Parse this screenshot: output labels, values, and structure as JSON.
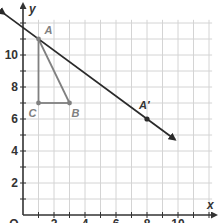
{
  "chart_data": {
    "type": "scatter",
    "title": "",
    "xlabel": "x",
    "ylabel": "y",
    "xlim": [
      0,
      12.5
    ],
    "ylim": [
      0,
      12
    ],
    "grid": true,
    "x_ticks": [
      0,
      2,
      4,
      6,
      8,
      10
    ],
    "y_ticks": [
      2,
      4,
      6,
      8,
      10
    ],
    "x_tick_labels": [
      "O",
      "2",
      "4",
      "6",
      "8",
      "10"
    ],
    "y_tick_labels": [
      "2",
      "4",
      "6",
      "8",
      "10"
    ],
    "points": [
      {
        "label": "A",
        "x": 1,
        "y": 11
      },
      {
        "label": "B",
        "x": 3,
        "y": 7
      },
      {
        "label": "C",
        "x": 1,
        "y": 7
      },
      {
        "label": "A'",
        "x": 8,
        "y": 6
      }
    ],
    "segments": [
      {
        "from": "A",
        "to": "C"
      },
      {
        "from": "C",
        "to": "B"
      },
      {
        "from": "A",
        "to": "B"
      }
    ],
    "line": {
      "through": [
        "A",
        "A'"
      ],
      "slope": -0.714,
      "arrows": "both",
      "x_range": [
        -1.2,
        9.8
      ]
    },
    "colors": {
      "triangle": "#808080",
      "line": "#2a2a2a",
      "grid": "#d4d4d4",
      "axis": "#333333"
    }
  },
  "axes": {
    "x_label": "x",
    "y_label": "y",
    "origin_label": "O"
  },
  "labels": {
    "A": "A",
    "B": "B",
    "C": "C",
    "A_prime": "A′"
  }
}
